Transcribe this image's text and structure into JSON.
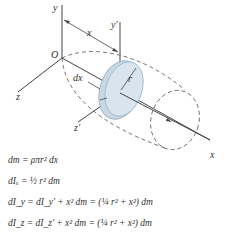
{
  "figure": {
    "labels": {
      "y": "y",
      "y_prime": "y′",
      "x_dist": "x",
      "origin": "O",
      "dx": "dx",
      "r": "r",
      "z": "z",
      "z_prime": "z′",
      "x_axis": "x"
    },
    "colors": {
      "disk_fill": "#c9d9e4",
      "disk_edge": "#9fb6c6",
      "line": "#444444"
    }
  },
  "equations": [
    "dm = ρπr² dx",
    "dIₓ = ½ r² dm",
    "dI_y = dI_y′ + x² dm = (¼ r² + x²) dm",
    "dI_z = dI_z′ + x² dm = (¼ r² + x²) dm"
  ]
}
